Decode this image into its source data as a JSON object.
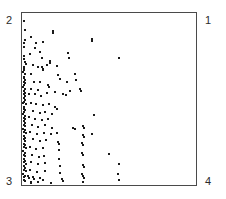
{
  "figure": {
    "background_color": "#ffffff",
    "frame_color": "#4a4a4a",
    "marker_color": "#1a1a1a",
    "label_color": "#2b2b2b"
  },
  "corner_labels": {
    "top_left": "2",
    "top_right": "1",
    "bottom_left": "3",
    "bottom_right": "4"
  },
  "chart_data": {
    "type": "scatter",
    "title": "",
    "xlabel": "",
    "ylabel": "",
    "xlim": [
      0,
      1
    ],
    "ylim": [
      0,
      1
    ],
    "grid": false,
    "legend": null,
    "annotations": [
      {
        "text": "2",
        "position": "top-left-outside"
      },
      {
        "text": "1",
        "position": "top-right-outside"
      },
      {
        "text": "3",
        "position": "bottom-left-outside"
      },
      {
        "text": "4",
        "position": "bottom-right-outside"
      }
    ],
    "marker": {
      "shape": "square",
      "size_px": 2,
      "color": "#1a1a1a"
    },
    "n_points": 152,
    "points": [
      [
        0.006,
        0.96
      ],
      [
        0.012,
        0.905
      ],
      [
        0.045,
        0.862
      ],
      [
        0.01,
        0.845
      ],
      [
        0.008,
        0.829
      ],
      [
        0.078,
        0.83
      ],
      [
        0.004,
        0.805
      ],
      [
        0.118,
        0.838
      ],
      [
        0.068,
        0.798
      ],
      [
        0.096,
        0.776
      ],
      [
        0.038,
        0.762
      ],
      [
        0.004,
        0.755
      ],
      [
        0.172,
        0.9
      ],
      [
        0.176,
        0.89
      ],
      [
        0.007,
        0.735
      ],
      [
        0.112,
        0.74
      ],
      [
        0.009,
        0.72
      ],
      [
        0.016,
        0.706
      ],
      [
        0.005,
        0.69
      ],
      [
        0.003,
        0.678
      ],
      [
        0.006,
        0.668
      ],
      [
        0.002,
        0.658
      ],
      [
        0.011,
        0.65
      ],
      [
        0.059,
        0.7
      ],
      [
        0.087,
        0.688
      ],
      [
        0.113,
        0.69
      ],
      [
        0.115,
        0.678
      ],
      [
        0.117,
        0.668
      ],
      [
        0.045,
        0.645
      ],
      [
        0.008,
        0.632
      ],
      [
        0.004,
        0.622
      ],
      [
        0.009,
        0.612
      ],
      [
        0.155,
        0.725
      ],
      [
        0.158,
        0.714
      ],
      [
        0.142,
        0.7
      ],
      [
        0.196,
        0.695
      ],
      [
        0.206,
        0.64
      ],
      [
        0.262,
        0.77
      ],
      [
        0.266,
        0.74
      ],
      [
        0.003,
        0.6
      ],
      [
        0.014,
        0.592
      ],
      [
        0.062,
        0.6
      ],
      [
        0.1,
        0.598
      ],
      [
        0.006,
        0.58
      ],
      [
        0.002,
        0.57
      ],
      [
        0.01,
        0.56
      ],
      [
        0.048,
        0.56
      ],
      [
        0.088,
        0.552
      ],
      [
        0.145,
        0.58
      ],
      [
        0.152,
        0.568
      ],
      [
        0.215,
        0.62
      ],
      [
        0.258,
        0.6
      ],
      [
        0.3,
        0.648
      ],
      [
        0.31,
        0.61
      ],
      [
        0.4,
        0.852
      ],
      [
        0.404,
        0.84
      ],
      [
        0.556,
        0.742
      ],
      [
        0.005,
        0.548
      ],
      [
        0.013,
        0.538
      ],
      [
        0.004,
        0.528
      ],
      [
        0.009,
        0.518
      ],
      [
        0.033,
        0.53
      ],
      [
        0.07,
        0.528
      ],
      [
        0.104,
        0.52
      ],
      [
        0.14,
        0.535
      ],
      [
        0.186,
        0.54
      ],
      [
        0.23,
        0.53
      ],
      [
        0.25,
        0.522
      ],
      [
        0.272,
        0.545
      ],
      [
        0.333,
        0.56
      ],
      [
        0.34,
        0.548
      ],
      [
        0.003,
        0.505
      ],
      [
        0.011,
        0.495
      ],
      [
        0.006,
        0.485
      ],
      [
        0.002,
        0.475
      ],
      [
        0.015,
        0.468
      ],
      [
        0.044,
        0.478
      ],
      [
        0.078,
        0.47
      ],
      [
        0.116,
        0.462
      ],
      [
        0.15,
        0.47
      ],
      [
        0.186,
        0.452
      ],
      [
        0.196,
        0.44
      ],
      [
        0.008,
        0.455
      ],
      [
        0.004,
        0.444
      ],
      [
        0.012,
        0.434
      ],
      [
        0.007,
        0.424
      ],
      [
        0.058,
        0.428
      ],
      [
        0.098,
        0.418
      ],
      [
        0.13,
        0.425
      ],
      [
        0.168,
        0.412
      ],
      [
        0.002,
        0.41
      ],
      [
        0.01,
        0.4
      ],
      [
        0.005,
        0.39
      ],
      [
        0.014,
        0.382
      ],
      [
        0.036,
        0.392
      ],
      [
        0.072,
        0.385
      ],
      [
        0.11,
        0.378
      ],
      [
        0.148,
        0.38
      ],
      [
        0.415,
        0.405
      ],
      [
        0.003,
        0.368
      ],
      [
        0.009,
        0.358
      ],
      [
        0.006,
        0.348
      ],
      [
        0.012,
        0.34
      ],
      [
        0.05,
        0.348
      ],
      [
        0.09,
        0.338
      ],
      [
        0.128,
        0.345
      ],
      [
        0.166,
        0.332
      ],
      [
        0.29,
        0.33
      ],
      [
        0.3,
        0.322
      ],
      [
        0.35,
        0.342
      ],
      [
        0.355,
        0.33
      ],
      [
        0.002,
        0.325
      ],
      [
        0.011,
        0.316
      ],
      [
        0.005,
        0.306
      ],
      [
        0.015,
        0.298
      ],
      [
        0.042,
        0.305
      ],
      [
        0.082,
        0.296
      ],
      [
        0.12,
        0.302
      ],
      [
        0.16,
        0.292
      ],
      [
        0.2,
        0.3
      ],
      [
        0.348,
        0.288
      ],
      [
        0.352,
        0.276
      ],
      [
        0.4,
        0.292
      ],
      [
        0.004,
        0.282
      ],
      [
        0.01,
        0.272
      ],
      [
        0.007,
        0.262
      ],
      [
        0.013,
        0.254
      ],
      [
        0.056,
        0.262
      ],
      [
        0.096,
        0.252
      ],
      [
        0.134,
        0.258
      ],
      [
        0.205,
        0.248
      ],
      [
        0.212,
        0.236
      ],
      [
        0.345,
        0.24
      ],
      [
        0.348,
        0.228
      ],
      [
        0.003,
        0.238
      ],
      [
        0.012,
        0.228
      ],
      [
        0.006,
        0.218
      ],
      [
        0.016,
        0.21
      ],
      [
        0.038,
        0.216
      ],
      [
        0.074,
        0.205
      ],
      [
        0.118,
        0.212
      ],
      [
        0.208,
        0.2
      ],
      [
        0.345,
        0.185
      ],
      [
        0.348,
        0.172
      ],
      [
        0.5,
        0.178
      ],
      [
        0.002,
        0.192
      ],
      [
        0.009,
        0.182
      ],
      [
        0.005,
        0.172
      ],
      [
        0.014,
        0.164
      ],
      [
        0.052,
        0.172
      ],
      [
        0.092,
        0.16
      ],
      [
        0.124,
        0.166
      ],
      [
        0.21,
        0.15
      ],
      [
        0.56,
        0.12
      ],
      [
        0.004,
        0.148
      ],
      [
        0.011,
        0.138
      ],
      [
        0.007,
        0.128
      ],
      [
        0.017,
        0.12
      ],
      [
        0.046,
        0.128
      ],
      [
        0.086,
        0.116
      ],
      [
        0.13,
        0.122
      ],
      [
        0.214,
        0.108
      ],
      [
        0.348,
        0.112
      ],
      [
        0.352,
        0.1
      ],
      [
        0.003,
        0.104
      ],
      [
        0.01,
        0.094
      ],
      [
        0.006,
        0.084
      ],
      [
        0.015,
        0.076
      ],
      [
        0.04,
        0.084
      ],
      [
        0.08,
        0.072
      ],
      [
        0.126,
        0.078
      ],
      [
        0.218,
        0.062
      ],
      [
        0.345,
        0.058
      ],
      [
        0.35,
        0.046
      ],
      [
        0.352,
        0.036
      ],
      [
        0.552,
        0.06
      ],
      [
        0.558,
        0.022
      ],
      [
        0.002,
        0.06
      ],
      [
        0.013,
        0.05
      ],
      [
        0.008,
        0.04
      ],
      [
        0.03,
        0.048
      ],
      [
        0.034,
        0.038
      ],
      [
        0.06,
        0.042
      ],
      [
        0.064,
        0.03
      ],
      [
        0.098,
        0.034
      ],
      [
        0.118,
        0.022
      ],
      [
        0.225,
        0.03
      ],
      [
        0.23,
        0.018
      ],
      [
        0.005,
        0.026
      ],
      [
        0.012,
        0.016
      ],
      [
        0.044,
        0.014
      ],
      [
        0.048,
        0.008
      ],
      [
        0.088,
        0.01
      ],
      [
        0.16,
        0.006
      ],
      [
        0.348,
        0.012
      ]
    ]
  }
}
